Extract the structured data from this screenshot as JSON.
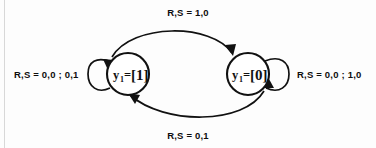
{
  "diagram": {
    "type": "state-transition-diagram",
    "title": "",
    "background_color": "#fdfdfd",
    "line_color": "#111111",
    "states": [
      {
        "id": "state-left",
        "label_var": "y",
        "label_subscript": "1",
        "label_equals": "=",
        "label_value": "[1]",
        "full_label": "y1 = [1]",
        "cx": 128,
        "cy": 74,
        "r": 21
      },
      {
        "id": "state-right",
        "label_var": "y",
        "label_subscript": "1",
        "label_equals": "=",
        "label_value": "[0]",
        "full_label": "y1 = [0]",
        "cx": 248,
        "cy": 74,
        "r": 21
      }
    ],
    "transitions": [
      {
        "id": "transition-top",
        "from": "state-left",
        "to": "state-right",
        "label": "R,S = 1,0",
        "position": "top"
      },
      {
        "id": "transition-bottom",
        "from": "state-right",
        "to": "state-left",
        "label": "R,S = 0,1",
        "position": "bottom"
      },
      {
        "id": "self-loop-left",
        "from": "state-left",
        "to": "state-left",
        "label": "R,S = 0,0 ; 0,1",
        "position": "left"
      },
      {
        "id": "self-loop-right",
        "from": "state-right",
        "to": "state-right",
        "label": "R,S = 0,0 ; 1,0",
        "position": "right"
      }
    ]
  }
}
